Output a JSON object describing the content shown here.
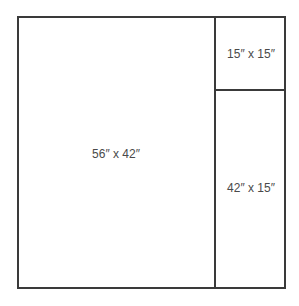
{
  "diagram": {
    "panels": [
      {
        "id": "large",
        "label": "56″ x 42″"
      },
      {
        "id": "small-square",
        "label": "15″ x 15″"
      },
      {
        "id": "tall-strip",
        "label": "42″ x 15″"
      }
    ],
    "colors": {
      "line": "#3a3a3a",
      "text": "#4a4a4a",
      "background": "#ffffff"
    }
  }
}
